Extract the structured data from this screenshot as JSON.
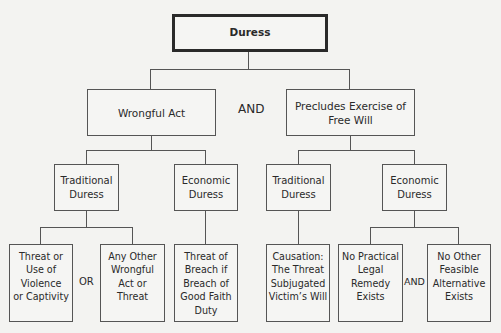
{
  "diagram": {
    "root": {
      "label": "Duress"
    },
    "level1_conjunction": "AND",
    "branches": [
      {
        "label": "Wrongful Act",
        "children": [
          {
            "label_line1": "Traditional",
            "label_line2": "Duress",
            "conjunction": "OR",
            "children": [
              {
                "lines": [
                  "Threat or",
                  "Use of",
                  "Violence",
                  "or Captivity"
                ]
              },
              {
                "lines": [
                  "Any Other",
                  "Wrongful",
                  "Act or",
                  "Threat"
                ]
              }
            ]
          },
          {
            "label_line1": "Economic",
            "label_line2": "Duress",
            "children": [
              {
                "lines": [
                  "Threat of",
                  "Breach if",
                  "Breach of",
                  "Good Faith",
                  "Duty"
                ]
              }
            ]
          }
        ]
      },
      {
        "label_line1": "Precludes Exercise of",
        "label_line2": "Free Will",
        "children": [
          {
            "label_line1": "Traditional",
            "label_line2": "Duress",
            "children": [
              {
                "lines": [
                  "Causation:",
                  "The Threat",
                  "Subjugated",
                  "Victim’s Will"
                ]
              }
            ]
          },
          {
            "label_line1": "Economic",
            "label_line2": "Duress",
            "conjunction": "AND",
            "children": [
              {
                "lines": [
                  "No Practical",
                  "Legal",
                  "Remedy",
                  "Exists"
                ]
              },
              {
                "lines": [
                  "No Other",
                  "Feasible",
                  "Alternative",
                  "Exists"
                ]
              }
            ]
          }
        ]
      }
    ]
  },
  "colors": {
    "line": "#555555",
    "root_border": "#2a2a2a",
    "background": "#f3f3f1"
  }
}
